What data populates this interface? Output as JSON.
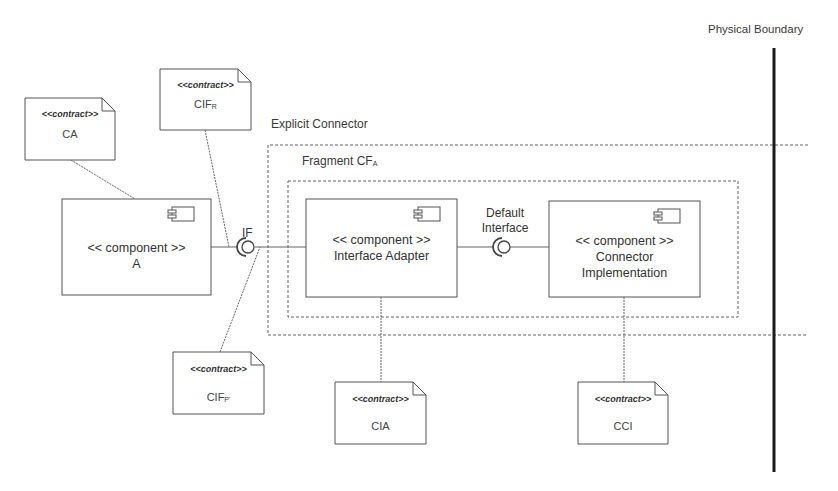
{
  "physical_boundary": {
    "label": "Physical Boundary"
  },
  "explicit_connector": {
    "label": "Explicit Connector"
  },
  "fragment": {
    "label": "Fragment CF",
    "sub": "A"
  },
  "components": [
    {
      "id": "component-a",
      "stereotype": "<< component >>",
      "name": "A"
    },
    {
      "id": "interface-adapter",
      "stereotype": "<< component >>",
      "name": "Interface Adapter"
    },
    {
      "id": "connector-implementation",
      "stereotype": "<< component >>",
      "name": "Connector Implementation",
      "name_line1": "Connector",
      "name_line2": "Implementation"
    }
  ],
  "interfaces": [
    {
      "id": "if",
      "label": "IF"
    },
    {
      "id": "default-interface",
      "label": "Default Interface",
      "line1": "Default",
      "line2": "Interface"
    }
  ],
  "notes": [
    {
      "id": "ca",
      "stereotype": "<<contract>>",
      "name": "CA",
      "sub": ""
    },
    {
      "id": "cif-r",
      "stereotype": "<<contract>>",
      "name": "CIF",
      "sub": "R"
    },
    {
      "id": "cif-p",
      "stereotype": "<<contract>>",
      "name": "CIF",
      "sub": "P'"
    },
    {
      "id": "cia",
      "stereotype": "<<contract>>",
      "name": "CIA",
      "sub": ""
    },
    {
      "id": "cci",
      "stereotype": "<<contract>>",
      "name": "CCI",
      "sub": ""
    }
  ]
}
